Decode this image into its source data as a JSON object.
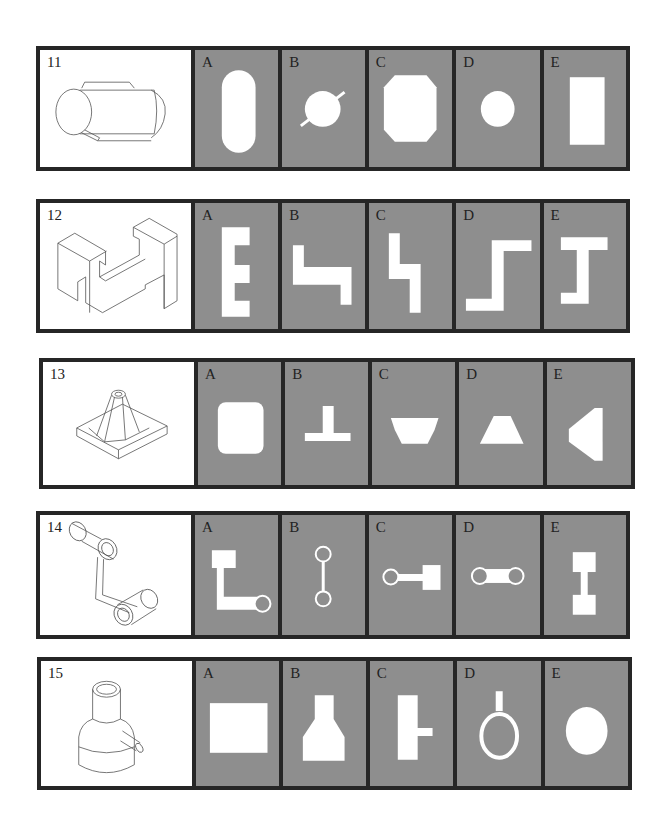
{
  "colors": {
    "border": "#262626",
    "option_bg": "#8e8e8e",
    "shape": "#ffffff",
    "iso_bg": "#ffffff"
  },
  "problems": [
    {
      "number": "11",
      "isometric": "horizontal cylinder with rounded ends and a side rod",
      "options": [
        {
          "letter": "A",
          "shape": "vertical-stadium"
        },
        {
          "letter": "B",
          "shape": "circle-with-diagonal-line"
        },
        {
          "letter": "C",
          "shape": "octagon"
        },
        {
          "letter": "D",
          "shape": "circle"
        },
        {
          "letter": "E",
          "shape": "vertical-rectangle"
        }
      ]
    },
    {
      "number": "12",
      "isometric": "H-shaped block with notches",
      "options": [
        {
          "letter": "A",
          "shape": "letter-E-shape"
        },
        {
          "letter": "B",
          "shape": "step-shape-horizontal"
        },
        {
          "letter": "C",
          "shape": "step-shape-vertical"
        },
        {
          "letter": "D",
          "shape": "z-step-shape"
        },
        {
          "letter": "E",
          "shape": "I-beam-shape"
        }
      ]
    },
    {
      "number": "13",
      "isometric": "square base with central tapered tube and ribs",
      "options": [
        {
          "letter": "A",
          "shape": "rounded-square"
        },
        {
          "letter": "B",
          "shape": "inverted-T"
        },
        {
          "letter": "C",
          "shape": "inverted-trapezoid"
        },
        {
          "letter": "D",
          "shape": "trapezoid"
        },
        {
          "letter": "E",
          "shape": "left-pointing-trapezoid"
        }
      ]
    },
    {
      "number": "14",
      "isometric": "two cylinders joined by a bent link",
      "options": [
        {
          "letter": "A",
          "shape": "L-shape-with-circle"
        },
        {
          "letter": "B",
          "shape": "vertical-dumbbell-rings"
        },
        {
          "letter": "C",
          "shape": "ring-bar-square"
        },
        {
          "letter": "D",
          "shape": "horizontal-dumbbell-rings"
        },
        {
          "letter": "E",
          "shape": "vertical-dumbbell-squares"
        }
      ]
    },
    {
      "number": "15",
      "isometric": "stepped cylinder with side spout",
      "options": [
        {
          "letter": "A",
          "shape": "rectangle"
        },
        {
          "letter": "B",
          "shape": "bottle-shape"
        },
        {
          "letter": "C",
          "shape": "rectangle-with-side-tab"
        },
        {
          "letter": "D",
          "shape": "ring-with-stem"
        },
        {
          "letter": "E",
          "shape": "ellipse"
        }
      ]
    }
  ]
}
